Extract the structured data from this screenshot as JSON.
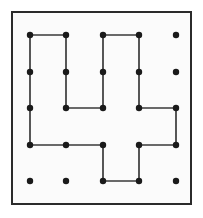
{
  "figure": {
    "name": "nine-dot-style-grid-puzzle",
    "colors": {
      "page_background": "#ffffff",
      "frame_background": "#fbfbfb",
      "frame_border": "#2b2b2b",
      "dot": "#1a1a1a",
      "line": "#3a3a3a"
    },
    "frame": {
      "x": 11,
      "y": 11,
      "width": 181,
      "height": 194,
      "border_width": 2
    },
    "grid": {
      "rows": 5,
      "columns": 5,
      "dot_radius": 3.2,
      "column_x": [
        30,
        66,
        103,
        139,
        176
      ],
      "row_y": [
        35,
        72,
        108,
        145,
        181
      ],
      "dot_count": 25
    },
    "dots": [
      {
        "id": "r1c1",
        "row": 1,
        "col": 1,
        "x": 30,
        "y": 35
      },
      {
        "id": "r1c2",
        "row": 1,
        "col": 2,
        "x": 66,
        "y": 35
      },
      {
        "id": "r1c3",
        "row": 1,
        "col": 3,
        "x": 103,
        "y": 35
      },
      {
        "id": "r1c4",
        "row": 1,
        "col": 4,
        "x": 139,
        "y": 35
      },
      {
        "id": "r1c5",
        "row": 1,
        "col": 5,
        "x": 176,
        "y": 35
      },
      {
        "id": "r2c1",
        "row": 2,
        "col": 1,
        "x": 30,
        "y": 72
      },
      {
        "id": "r2c2",
        "row": 2,
        "col": 2,
        "x": 66,
        "y": 72
      },
      {
        "id": "r2c3",
        "row": 2,
        "col": 3,
        "x": 103,
        "y": 72
      },
      {
        "id": "r2c4",
        "row": 2,
        "col": 4,
        "x": 139,
        "y": 72
      },
      {
        "id": "r2c5",
        "row": 2,
        "col": 5,
        "x": 176,
        "y": 72
      },
      {
        "id": "r3c1",
        "row": 3,
        "col": 1,
        "x": 30,
        "y": 108
      },
      {
        "id": "r3c2",
        "row": 3,
        "col": 2,
        "x": 66,
        "y": 108
      },
      {
        "id": "r3c3",
        "row": 3,
        "col": 3,
        "x": 103,
        "y": 108
      },
      {
        "id": "r3c4",
        "row": 3,
        "col": 4,
        "x": 139,
        "y": 108
      },
      {
        "id": "r3c5",
        "row": 3,
        "col": 5,
        "x": 176,
        "y": 108
      },
      {
        "id": "r4c1",
        "row": 4,
        "col": 1,
        "x": 30,
        "y": 145
      },
      {
        "id": "r4c2",
        "row": 4,
        "col": 2,
        "x": 66,
        "y": 145
      },
      {
        "id": "r4c3",
        "row": 4,
        "col": 3,
        "x": 103,
        "y": 145
      },
      {
        "id": "r4c4",
        "row": 4,
        "col": 4,
        "x": 139,
        "y": 145
      },
      {
        "id": "r4c5",
        "row": 4,
        "col": 5,
        "x": 176,
        "y": 145
      },
      {
        "id": "r5c1",
        "row": 5,
        "col": 1,
        "x": 30,
        "y": 181
      },
      {
        "id": "r5c2",
        "row": 5,
        "col": 2,
        "x": 66,
        "y": 181
      },
      {
        "id": "r5c3",
        "row": 5,
        "col": 3,
        "x": 103,
        "y": 181
      },
      {
        "id": "r5c4",
        "row": 5,
        "col": 4,
        "x": 139,
        "y": 181
      },
      {
        "id": "r5c5",
        "row": 5,
        "col": 5,
        "x": 176,
        "y": 181
      }
    ],
    "paths": [
      {
        "id": "left-arm-path",
        "points": "66,35 30,35 30,145 66,145 103,145 103,181",
        "vertices": [
          "r1c2",
          "r1c1",
          "r4c1",
          "r4c2",
          "r4c3",
          "r5c3"
        ]
      },
      {
        "id": "center-arm-path",
        "points": "66,108 66,35",
        "vertices": [
          "r3c2",
          "r1c2"
        ]
      },
      {
        "id": "upper-inner-path",
        "points": "66,108 103,108 103,35 139,35 139,108 176,108 176,145 139,145 139,181 103,181",
        "vertices": [
          "r3c2",
          "r3c3",
          "r1c3",
          "r1c4",
          "r3c4",
          "r3c5",
          "r4c5",
          "r4c4",
          "r5c4",
          "r5c3"
        ]
      }
    ],
    "isolated_dots": [
      "r1c5",
      "r2c5",
      "r5c1",
      "r5c2",
      "r5c5"
    ]
  }
}
